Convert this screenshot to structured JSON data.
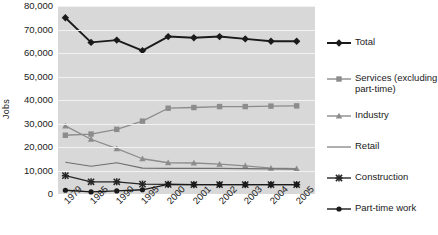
{
  "chart_data": {
    "type": "line",
    "title": "",
    "xlabel": "",
    "ylabel": "Jobs",
    "categories": [
      "1979",
      "1985",
      "1990",
      "1995",
      "2000",
      "2001",
      "2002",
      "2003",
      "2004",
      "2005"
    ],
    "ylim": [
      0,
      80000
    ],
    "ytick_labels": [
      "80,000",
      "70,000",
      "60,000",
      "50,000",
      "40,000",
      "30,000",
      "20,000",
      "10,000",
      "0"
    ],
    "ytick_values": [
      80000,
      70000,
      60000,
      50000,
      40000,
      30000,
      20000,
      10000,
      0
    ],
    "grid": true,
    "legend_position": "right",
    "series": [
      {
        "name": "Total",
        "marker": "diamond",
        "color": "#1a1a1a",
        "values": [
          75000,
          64500,
          65500,
          61000,
          67000,
          66500,
          67000,
          66000,
          65000,
          65000
        ]
      },
      {
        "name": "Services (excluding\npart-time)",
        "marker": "square",
        "color": "#8c8c8c",
        "values": [
          25000,
          25500,
          27500,
          31000,
          36500,
          36800,
          37200,
          37200,
          37400,
          37500
        ]
      },
      {
        "name": "Industry",
        "marker": "triangle",
        "color": "#8c8c8c",
        "values": [
          29000,
          23300,
          19300,
          15000,
          13300,
          13200,
          12700,
          12000,
          11000,
          10800
        ]
      },
      {
        "name": "Retail",
        "marker": "none",
        "color": "#6e6e6e",
        "values": [
          13500,
          11800,
          13300,
          11000,
          10900,
          10900,
          10900,
          10800,
          10700,
          10500
        ]
      },
      {
        "name": "Construction",
        "marker": "x",
        "color": "#262626",
        "values": [
          7800,
          5200,
          5200,
          4200,
          4100,
          4000,
          4000,
          4000,
          4000,
          4000
        ]
      },
      {
        "name": "Part-time work",
        "marker": "circle",
        "color": "#1a1a1a",
        "values": [
          1600,
          900,
          1300,
          1800,
          4100,
          4000,
          4000,
          4000,
          4000,
          4000
        ]
      }
    ]
  }
}
